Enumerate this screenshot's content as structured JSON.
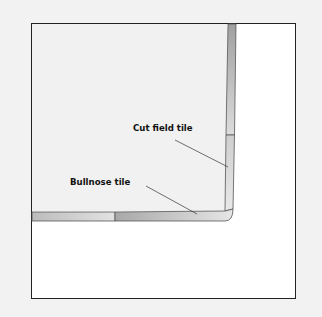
{
  "labels": {
    "cut_field_tile": "Cut field tile",
    "bullnose_tile": "Bullnose tile"
  },
  "colors": {
    "background": "#f2f2f2",
    "frame": "#222222",
    "tile_dark": "#a6a6a6",
    "tile_light": "#e6e6e6"
  }
}
